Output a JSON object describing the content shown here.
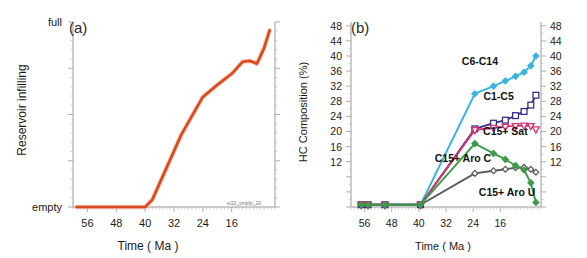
{
  "figure": {
    "panel_a_label": "(a)",
    "panel_b_label": "(b)",
    "watermark": "el22_cmpfp_20"
  },
  "chart_data": [
    {
      "type": "line",
      "panel": "(a)",
      "title": "",
      "xlabel": "Time ( Ma )",
      "ylabel": "Reservoir infilling",
      "xlim": [
        60,
        4
      ],
      "x_reversed": true,
      "xticks": [
        56,
        48,
        40,
        32,
        24,
        16
      ],
      "xticklabels": [
        "56",
        "48",
        "40",
        "32",
        "24",
        "16"
      ],
      "ylim": [
        0,
        1
      ],
      "yticks": [
        0,
        1
      ],
      "yticklabels": [
        "empty",
        "full"
      ],
      "grid": false,
      "legend": "none",
      "series": [
        {
          "name": "Reservoir infilling",
          "color": "#D94A20",
          "marker": "none",
          "x": [
            59,
            56,
            52,
            48,
            44,
            40,
            38,
            30,
            24,
            20,
            16,
            13,
            11,
            9,
            7,
            5.5
          ],
          "values": [
            0.0,
            0.0,
            0.0,
            0.0,
            0.0,
            0.0,
            0.04,
            0.39,
            0.595,
            0.66,
            0.72,
            0.785,
            0.79,
            0.775,
            0.86,
            0.955
          ]
        }
      ]
    },
    {
      "type": "line",
      "panel": "(b)",
      "title": "",
      "xlabel": "Time ( Ma )",
      "ylabel": "HC Composition (%)",
      "xlim": [
        60,
        4
      ],
      "x_reversed": true,
      "xticks": [
        56,
        48,
        40,
        32,
        24,
        16
      ],
      "xticklabels": [
        "56",
        "48",
        "40",
        "32",
        "24",
        "16"
      ],
      "ylim": [
        0,
        49
      ],
      "yticks": [
        12,
        16,
        20,
        24,
        28,
        32,
        36,
        40,
        44,
        48
      ],
      "yticklabels": [
        "12",
        "16",
        "20",
        "24",
        "28",
        "32",
        "36",
        "40",
        "44",
        "48"
      ],
      "y_axis_both_sides": true,
      "grid": false,
      "legend": "inline-annotations",
      "series": [
        {
          "name": "C6-C14",
          "color": "#3BB3E0",
          "marker": "diamond",
          "label_x": 22.0,
          "label_y": 37.6,
          "x": [
            57,
            55,
            50,
            39.5,
            23.5,
            18,
            14.5,
            11.5,
            9,
            7,
            5.5
          ],
          "values": [
            0.6,
            0.6,
            0.6,
            0.6,
            30.0,
            32.0,
            33.4,
            34.6,
            35.7,
            37.4,
            40.0
          ]
        },
        {
          "name": "C1-C5",
          "color": "#3A2F86",
          "marker": "square",
          "label_x": 16.5,
          "label_y": 28.4,
          "x": [
            57,
            55,
            50,
            39.5,
            23.5,
            18,
            14.5,
            11.5,
            9,
            7,
            5.5
          ],
          "values": [
            0.6,
            0.6,
            0.6,
            0.6,
            20.7,
            22.2,
            23.0,
            24.2,
            25.3,
            27.0,
            29.6
          ]
        },
        {
          "name": "C15+ Sat",
          "color": "#D6336C",
          "marker": "triangle-down",
          "label_x": 14.5,
          "label_y": 19.2,
          "x": [
            57,
            55,
            50,
            39.5,
            23.5,
            18,
            14.5,
            11.5,
            9,
            7,
            5.5
          ],
          "values": [
            0.6,
            0.6,
            0.6,
            0.6,
            20.4,
            21.0,
            21.3,
            21.5,
            21.6,
            21.5,
            20.6
          ]
        },
        {
          "name": "C15+ Aro C",
          "color": "#5A5A5A",
          "marker": "diamond",
          "label_x": 27.0,
          "label_y": 12.0,
          "x": [
            57,
            55,
            50,
            39.5,
            23.5,
            18,
            14.5,
            11.5,
            9,
            7,
            5.5
          ],
          "values": [
            0.6,
            0.6,
            0.6,
            0.6,
            8.9,
            9.6,
            10.0,
            10.4,
            10.5,
            10.0,
            9.2
          ]
        },
        {
          "name": "C15+ Aro U",
          "color": "#3D9B47",
          "marker": "diamond",
          "label_x": 14.0,
          "label_y": 3.0,
          "x": [
            57,
            55,
            50,
            39.5,
            23.5,
            18,
            14.5,
            11.5,
            9,
            7,
            5.5
          ],
          "values": [
            0.6,
            0.6,
            0.6,
            0.6,
            16.8,
            14.2,
            12.6,
            11.0,
            9.8,
            6.4,
            1.2
          ]
        }
      ],
      "baseline_markers_x": [
        57,
        55,
        50
      ]
    }
  ]
}
